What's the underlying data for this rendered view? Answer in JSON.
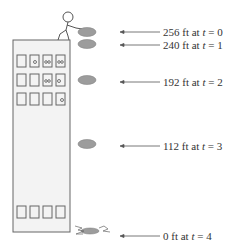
{
  "labels": [
    {
      "height": "256 ft",
      "mid": " at ",
      "var": "t",
      "eq": " = 0",
      "y": 26
    },
    {
      "height": "240 ft",
      "mid": " at ",
      "var": "t",
      "eq": " = 1",
      "y": 40
    },
    {
      "height": "192 ft",
      "mid": " at ",
      "var": "t",
      "eq": " = 2",
      "y": 77
    },
    {
      "height": "112 ft",
      "mid": " at ",
      "var": "t",
      "eq": " = 3",
      "y": 141
    },
    {
      "height": "0 ft",
      "mid": " at ",
      "var": "t",
      "eq": " = 4",
      "y": 230
    }
  ],
  "colors": {
    "building_fill": "#f2f2f2",
    "stroke": "#555555",
    "coin": "#9a9a9a",
    "text": "#333333"
  }
}
